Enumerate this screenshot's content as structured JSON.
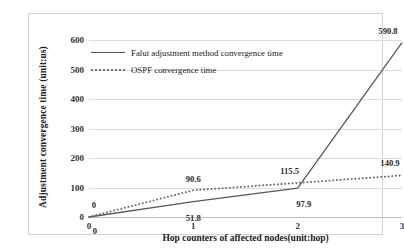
{
  "chart_data": {
    "type": "line",
    "title": "",
    "xlabel": "Hop counters of affected nodes(unit:hop)",
    "ylabel": "Adjustment convergence time (unit:us)",
    "x": [
      0,
      1,
      2,
      3
    ],
    "xticklabels": [
      "0",
      "1",
      "2",
      "3"
    ],
    "yticklabels": [
      "0",
      "100",
      "200",
      "300",
      "400",
      "500",
      "600"
    ],
    "yticks": [
      0,
      100,
      200,
      300,
      400,
      500,
      600
    ],
    "xlim": [
      0,
      3
    ],
    "ylim": [
      0,
      600
    ],
    "grid": "horizontal",
    "legend_position": "upper-left-inside",
    "series": [
      {
        "name": "Falut adjustment method convergence time",
        "style": "solid",
        "color": "#595959",
        "values": [
          0,
          51.8,
          97.9,
          590.8
        ],
        "labels": [
          "0",
          "51.8",
          "97.9",
          "590.8"
        ]
      },
      {
        "name": "OSPF convergence time",
        "style": "dotted",
        "color": "#6e6e6e",
        "values": [
          0,
          90.6,
          115.5,
          140.9
        ],
        "labels": [
          "0",
          "90.6",
          "115.5",
          "140.9"
        ]
      }
    ]
  },
  "legend": {
    "items": [
      {
        "label": "Falut adjustment method convergence time",
        "key": "solid-line-key"
      },
      {
        "label": "OSPF convergence time",
        "key": "dotted-line-key"
      }
    ]
  },
  "axes": {
    "y_title": "Adjustment convergence time (unit:us)",
    "x_title": "Hop counters of affected nodes(unit:hop)",
    "y_ticks": [
      "600",
      "500",
      "400",
      "300",
      "200",
      "100",
      "0"
    ],
    "x_ticks": [
      "0",
      "1",
      "2",
      "3"
    ]
  },
  "data_labels": {
    "fault": [
      "0",
      "51.8",
      "97.9",
      "590.8"
    ],
    "ospf": [
      "0",
      "90.6",
      "115.5",
      "140.9"
    ]
  },
  "caption": {
    "text": ""
  },
  "colors": {
    "series_solid": "#595959",
    "series_dotted": "#6e6e6e",
    "gridline": "#dcdcdc",
    "border": "#d2d2d2",
    "text": "#2b2b2b"
  }
}
